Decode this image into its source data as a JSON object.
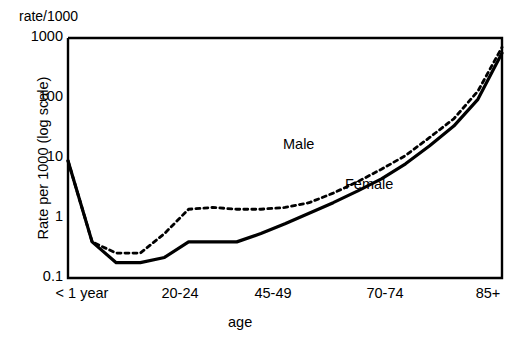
{
  "figure": {
    "corner_note": "rate/1000",
    "y_axis_title": "Rate per 1000 (log scale)",
    "x_axis_title": "age"
  },
  "axes": {
    "y_ticks": [
      {
        "label": "1000",
        "value": 1000
      },
      {
        "label": "100",
        "value": 100
      },
      {
        "label": "10",
        "value": 10
      },
      {
        "label": "1",
        "value": 1
      },
      {
        "label": "0.1",
        "value": 0.1
      }
    ],
    "x_ticks": [
      {
        "label": "< 1 year",
        "pos": 82
      },
      {
        "label": "20-24",
        "pos": 180
      },
      {
        "label": "45-49",
        "pos": 273
      },
      {
        "label": "70-74",
        "pos": 385
      },
      {
        "label": "85+",
        "pos": 488
      }
    ]
  },
  "series_labels": {
    "male": "Male",
    "female": "Female"
  },
  "chart_data": {
    "type": "line",
    "title": "",
    "subtitle": "",
    "xlabel": "age",
    "ylabel": "Rate per 1000 (log scale)",
    "annotation_top_left": "rate/1000",
    "yscale": "log",
    "ylim": [
      0.1,
      1000
    ],
    "y_tick_labels": [
      "1000",
      "100",
      "10",
      "1",
      "0.1"
    ],
    "y_tick_values": [
      1000,
      100,
      10,
      1,
      0.1
    ],
    "grid": false,
    "legend_position": "inline-annotations",
    "x_tick_labels": [
      "< 1 year",
      "20-24",
      "45-49",
      "70-74",
      "85+"
    ],
    "x_categories": [
      "< 1 year",
      "1-4",
      "5-9",
      "10-14",
      "15-19",
      "20-24",
      "25-29",
      "30-34",
      "35-39",
      "40-44",
      "45-49",
      "50-54",
      "55-59",
      "60-64",
      "65-69",
      "70-74",
      "75-79",
      "80-84",
      "85+"
    ],
    "series": [
      {
        "name": "Male",
        "style": "dashed",
        "color": "#000000",
        "values": [
          9.0,
          0.4,
          0.26,
          0.26,
          0.55,
          1.4,
          1.5,
          1.4,
          1.4,
          1.5,
          1.8,
          2.6,
          4.0,
          6.5,
          11,
          22,
          45,
          130,
          700
        ]
      },
      {
        "name": "Female",
        "style": "solid",
        "color": "#000000",
        "values": [
          9.0,
          0.4,
          0.18,
          0.18,
          0.22,
          0.4,
          0.4,
          0.4,
          0.55,
          0.8,
          1.2,
          1.8,
          2.8,
          4.5,
          8.0,
          16,
          34,
          95,
          560
        ]
      }
    ]
  }
}
